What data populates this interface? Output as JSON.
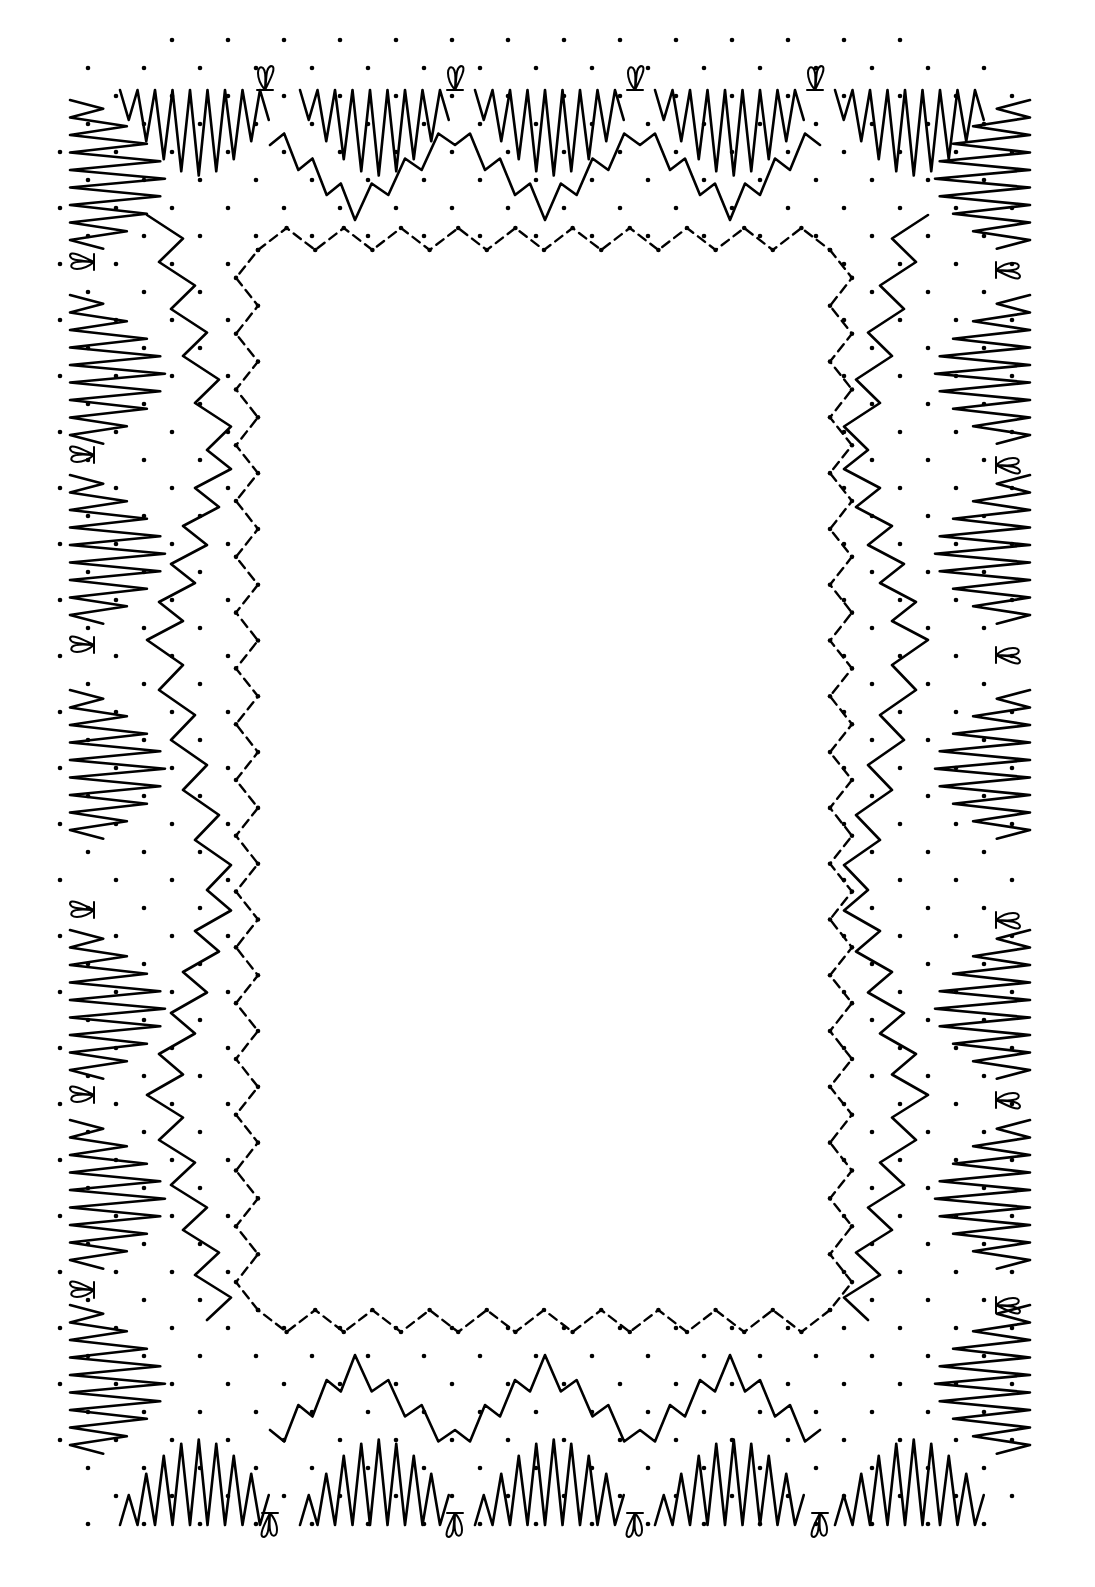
{
  "figure": {
    "title": "",
    "kind": "bobbin lace pricking - rectangular decorative frame",
    "colors": {
      "ink": "#000000",
      "paper": "#ffffff"
    }
  },
  "frame": {
    "outer": {
      "x": 60,
      "y": 40,
      "w": 975,
      "h": 1510,
      "corner_radius": 80
    },
    "inner_window": {
      "x": 258,
      "y": 250,
      "w": 572,
      "h": 1060
    },
    "dot_grid_spacing": 56,
    "fan_edge": {
      "top_fans_x": [
        190,
        370,
        545,
        725,
        905
      ],
      "bottom_fans_x": [
        190,
        370,
        545,
        725,
        905
      ],
      "left_fans_y": [
        170,
        365,
        545,
        760,
        1000,
        1190,
        1375
      ],
      "right_fans_y": [
        170,
        365,
        545,
        760,
        1000,
        1190,
        1375
      ],
      "fan_amplitude": 95
    },
    "tally_motifs": {
      "top_x": [
        265,
        455,
        635,
        815
      ],
      "bottom_x": [
        270,
        455,
        635,
        820
      ],
      "left_y": [
        262,
        455,
        645,
        910,
        1095,
        1290
      ],
      "right_y": [
        270,
        465,
        655,
        920,
        1100,
        1305
      ]
    },
    "zigzag_bands": {
      "top": {
        "y": 165,
        "valleys_x": [
          355,
          545,
          730
        ],
        "peaks_x": [
          270,
          455,
          640,
          820
        ]
      },
      "bottom": {
        "y": 1410,
        "valleys_x": [
          355,
          545,
          730
        ],
        "peaks_x": [
          270,
          455,
          640,
          820
        ]
      },
      "left": {
        "x": 175,
        "turns_y": [
          215,
          450,
          640,
          890,
          1095,
          1320
        ]
      },
      "right": {
        "x": 900,
        "turns_y": [
          215,
          450,
          640,
          890,
          1095,
          1320
        ]
      }
    },
    "inner_zigzag_frame": {
      "step": 56,
      "amplitude": 22
    }
  }
}
